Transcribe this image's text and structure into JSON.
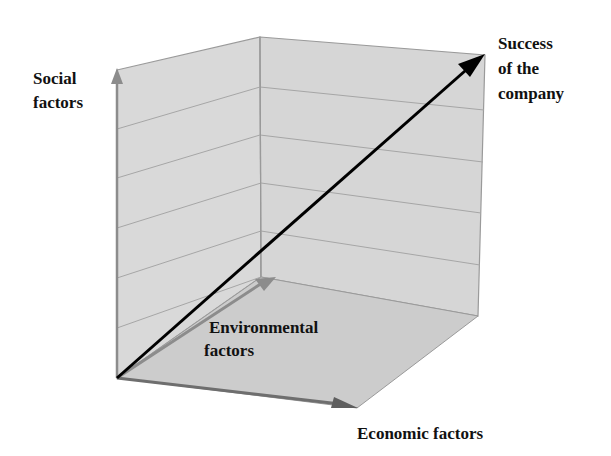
{
  "diagram": {
    "type": "3d-vector-axes",
    "labels": {
      "social": [
        "Social",
        "factors"
      ],
      "success": [
        "Success",
        "of the",
        "company"
      ],
      "environmental": [
        "Environmental",
        "factors"
      ],
      "economic": "Economic factors"
    },
    "axes": [
      {
        "name": "Social factors",
        "direction": "vertical"
      },
      {
        "name": "Environmental factors",
        "direction": "depth"
      },
      {
        "name": "Economic factors",
        "direction": "horizontal"
      }
    ],
    "resultant": "Success of the company",
    "colors": {
      "wall_fill": "#d9d9d9",
      "floor_fill": "#cfcfcf",
      "grid_line": "#9a9a9a",
      "axis_arrow": "#8c8c8c",
      "resultant_arrow": "#000000",
      "label_text": "#111111",
      "background": "#ffffff"
    }
  }
}
